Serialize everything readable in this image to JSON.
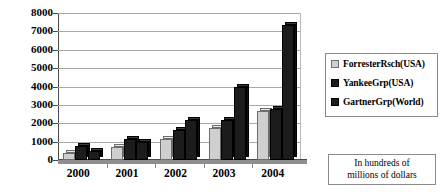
{
  "chart_data": {
    "type": "bar",
    "title": "",
    "xlabel": "",
    "ylabel": "",
    "ylim": [
      0,
      8000
    ],
    "ytick_step": 1000,
    "yticks": [
      "8000",
      "7000",
      "6000",
      "5000",
      "4000",
      "3000",
      "2000",
      "1000",
      "0"
    ],
    "grid": true,
    "legend_position": "right",
    "categories": [
      "2000",
      "2001",
      "2002",
      "2003",
      "2004"
    ],
    "series": [
      {
        "name": "ForresterRsch(USA)",
        "color": "#cfcfcf",
        "swatch": "light",
        "values": [
          400,
          700,
          1150,
          1750,
          2650
        ]
      },
      {
        "name": "YankeeGrp(USA)",
        "color": "#1c1c1c",
        "swatch": "dark",
        "values": [
          750,
          1150,
          1650,
          2150,
          2750
        ]
      },
      {
        "name": "GartnerGrp(World)",
        "color": "#1c1c1c",
        "swatch": "dark",
        "values": [
          500,
          1000,
          2200,
          4000,
          7350
        ]
      }
    ],
    "annotation": {
      "line1": "In hundreds of",
      "line2": "millions of dollars"
    }
  }
}
